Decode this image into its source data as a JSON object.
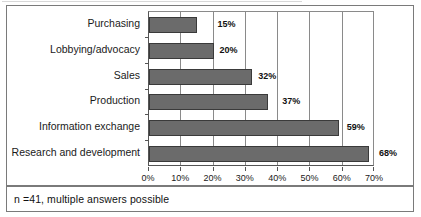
{
  "chart_data": {
    "type": "bar",
    "orientation": "horizontal",
    "title": "",
    "xlabel": "",
    "ylabel": "",
    "categories": [
      "Purchasing",
      "Lobbying/advocacy",
      "Sales",
      "Production",
      "Information exchange",
      "Research and development"
    ],
    "values": [
      15,
      20,
      32,
      37,
      59,
      68
    ],
    "value_labels": [
      "15%",
      "20%",
      "32%",
      "37%",
      "59%",
      "68%"
    ],
    "xlim": [
      0,
      70
    ],
    "xticks": [
      0,
      10,
      20,
      30,
      40,
      50,
      60,
      70
    ],
    "xtick_labels": [
      "0%",
      "10%",
      "20%",
      "30%",
      "40%",
      "50%",
      "60%",
      "70%"
    ],
    "grid": true,
    "legend": null,
    "bar_color": "#6b6b6b",
    "bar_edge_color": "#3a3a3a"
  },
  "footnote": {
    "text": "n =41, multiple answers possible"
  },
  "colors": {
    "border": "#7a7a7a",
    "axis": "#555555",
    "grid": "#8a8a8a",
    "bar_fill": "#6b6b6b",
    "text": "#1a1a1a",
    "background": "#ffffff"
  }
}
